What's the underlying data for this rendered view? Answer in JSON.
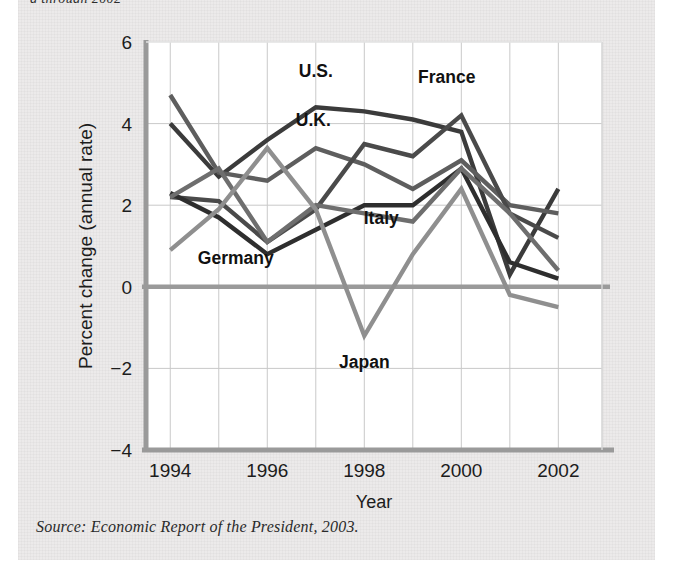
{
  "figure": {
    "headline_fragment": "g through 2002",
    "source_note": "Source: Economic Report of the President, 2003.",
    "panel_bg": "#eceaea"
  },
  "chart_data": {
    "type": "line",
    "title": "",
    "xlabel": "Year",
    "ylabel": "Percent change (annual rate)",
    "x": [
      1994,
      1995,
      1996,
      1997,
      1998,
      1999,
      2000,
      2001,
      2002
    ],
    "xticks": [
      "1994",
      "1996",
      "1998",
      "2000",
      "2002"
    ],
    "xtick_values": [
      1994,
      1996,
      1998,
      2000,
      2002
    ],
    "yticks": [
      "6",
      "4",
      "2",
      "0",
      "−2",
      "−4"
    ],
    "ytick_values": [
      6,
      4,
      2,
      0,
      -2,
      -4
    ],
    "xlim": [
      1993.5,
      2002.9
    ],
    "ylim": [
      -4,
      6
    ],
    "grid": true,
    "legend": "inline-labels",
    "zero_line": true,
    "series": [
      {
        "name": "U.S.",
        "color": "#3b3b3b",
        "width": 4.4,
        "values": [
          4.0,
          2.7,
          3.6,
          4.4,
          4.3,
          4.1,
          3.8,
          0.3,
          2.4
        ],
        "label_x": 1997.0,
        "label_y": 5.15
      },
      {
        "name": "U.K.",
        "color": "#5e5e5e",
        "width": 4.4,
        "values": [
          4.7,
          2.8,
          2.6,
          3.4,
          3.0,
          2.4,
          3.1,
          2.0,
          1.8
        ],
        "label_x": 1996.95,
        "label_y": 3.95
      },
      {
        "name": "France",
        "color": "#4a4a4a",
        "width": 4.4,
        "values": [
          2.2,
          2.1,
          1.1,
          1.9,
          3.5,
          3.2,
          4.2,
          1.8,
          1.2
        ],
        "label_x": 1999.7,
        "label_y": 5.0
      },
      {
        "name": "Germany",
        "color": "#2e2e2e",
        "width": 4.4,
        "values": [
          2.3,
          1.7,
          0.8,
          1.4,
          2.0,
          2.0,
          2.9,
          0.6,
          0.2
        ],
        "label_x": 1995.35,
        "label_y": 0.55
      },
      {
        "name": "Italy",
        "color": "#6e6e6e",
        "width": 4.4,
        "values": [
          2.2,
          2.9,
          1.1,
          2.0,
          1.8,
          1.6,
          2.9,
          1.8,
          0.4
        ],
        "label_x": 1998.35,
        "label_y": 1.55
      },
      {
        "name": "Japan",
        "color": "#8f8f8f",
        "width": 4.4,
        "values": [
          0.9,
          1.9,
          3.4,
          1.9,
          -1.2,
          0.8,
          2.4,
          -0.2,
          -0.5
        ],
        "label_x": 1998.0,
        "label_y": -2.0
      }
    ]
  }
}
